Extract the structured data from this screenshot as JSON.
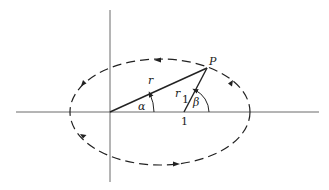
{
  "diagram": {
    "labels": {
      "point": "P",
      "radius": "r",
      "radius1_base": "r",
      "radius1_sub": "1",
      "alpha": "α",
      "beta": "β",
      "unit_mark": "1"
    },
    "colors": {
      "stroke": "#222222",
      "background": "#ffffff"
    },
    "orbit": {
      "style": "dashed",
      "direction": "counterclockwise"
    }
  }
}
